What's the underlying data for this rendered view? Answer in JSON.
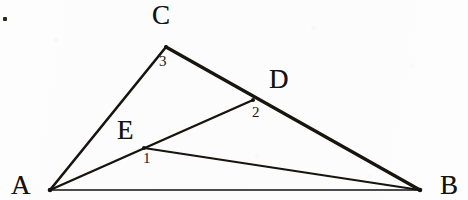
{
  "figure": {
    "width": 468,
    "height": 200,
    "background_color": "#fdfdfd",
    "ink_color": "#15130f"
  },
  "points": {
    "A": {
      "label": "A",
      "x": 50,
      "y": 190,
      "label_x": 11,
      "label_y": 172
    },
    "B": {
      "label": "B",
      "x": 420,
      "y": 190,
      "label_x": 440,
      "label_y": 172
    },
    "C": {
      "label": "C",
      "x": 166,
      "y": 47,
      "label_x": 152,
      "label_y": 2
    },
    "D": {
      "label": "D",
      "x": 253,
      "y": 100,
      "label_x": 269,
      "label_y": 66
    },
    "E": {
      "label": "E",
      "x": 144,
      "y": 148,
      "label_x": 117,
      "label_y": 117
    }
  },
  "segments": [
    {
      "name": "segment-AC",
      "from": "A",
      "to": "C",
      "width": 2.6
    },
    {
      "name": "segment-CB",
      "from": "C",
      "to": "B",
      "width": 3.2
    },
    {
      "name": "segment-AB",
      "from": "A",
      "to": "B",
      "width": 1.6
    },
    {
      "name": "segment-AD",
      "from": "A",
      "to": "D",
      "width": 2.4
    },
    {
      "name": "segment-EB",
      "from": "E",
      "to": "B",
      "width": 1.8
    }
  ],
  "angle_marks": [
    {
      "name": "angle-3-at-C",
      "label": "3",
      "x": 159,
      "y": 54
    },
    {
      "name": "angle-2-at-D",
      "label": "2",
      "x": 252,
      "y": 105
    },
    {
      "name": "angle-1-at-E",
      "label": "1",
      "x": 143,
      "y": 151
    }
  ],
  "artifacts": {
    "corner_speck": {
      "name": "scan-speck",
      "x": 3,
      "y": 17
    }
  }
}
